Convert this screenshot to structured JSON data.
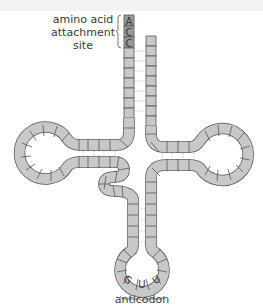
{
  "diagram": {
    "labels": {
      "attachment_line1": "amino acid",
      "attachment_line2": "attachment",
      "attachment_line3": "site",
      "anticodon": "anticodon"
    },
    "acceptor_bases": [
      "A",
      "C",
      "C"
    ],
    "anticodon_bases": [
      "G",
      "U",
      "U"
    ],
    "colors": {
      "nucleotide_fill": "#c8c8c8",
      "terminal_fill": "#9a9a9a",
      "outline": "#555555",
      "pairing_line": "#9a9a9a",
      "text": "#3a3a3a"
    }
  }
}
